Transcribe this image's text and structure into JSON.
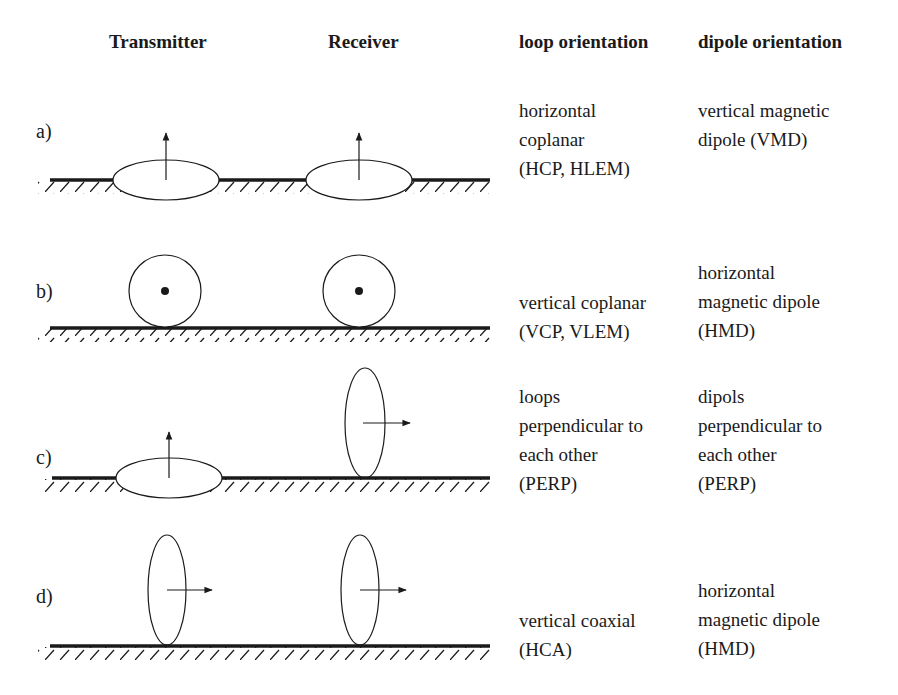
{
  "headers": {
    "transmitter": "Transmitter",
    "receiver": "Receiver",
    "loop_orientation": "loop orientation",
    "dipole_orientation": "dipole orientation"
  },
  "rows": [
    {
      "label": "a)",
      "loop_orientation": "horizontal\ncoplanar\n(HCP, HLEM)",
      "dipole_orientation": "vertical magnetic\ndipole (VMD)",
      "transmitter": "horizontal loop, dipole arrow up",
      "receiver": "horizontal loop, dipole arrow up"
    },
    {
      "label": "b)",
      "loop_orientation": "vertical coplanar\n(VCP, VLEM)",
      "dipole_orientation": "horizontal\nmagnetic dipole\n(HMD)",
      "transmitter": "vertical loop facing viewer, dipole out of page",
      "receiver": "vertical loop facing viewer, dipole out of page"
    },
    {
      "label": "c)",
      "loop_orientation": "loops\nperpendicular to\neach other\n(PERP)",
      "dipole_orientation": "dipols\nperpendicular to\neach other\n(PERP)",
      "transmitter": "horizontal loop, dipole arrow up",
      "receiver": "vertical loop, dipole arrow right"
    },
    {
      "label": "d)",
      "loop_orientation": "vertical  coaxial\n(HCA)",
      "dipole_orientation": "horizontal\nmagnetic dipole\n(HMD)",
      "transmitter": "vertical loop, dipole arrow right",
      "receiver": "vertical loop, dipole arrow right"
    }
  ],
  "colors": {
    "ink": "#1a1a1a",
    "background": "#ffffff"
  }
}
